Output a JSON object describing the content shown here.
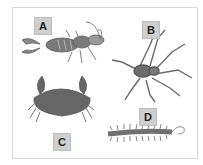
{
  "figure": {
    "panels": [
      {
        "label": "A",
        "animal": "earwig"
      },
      {
        "label": "B",
        "animal": "spider"
      },
      {
        "label": "C",
        "animal": "crab"
      },
      {
        "label": "D",
        "animal": "centipede"
      }
    ],
    "colors": {
      "label_bg": "#cfcfcf",
      "animal_fill": "#6e6e6e",
      "frame": "#d8d8d8"
    }
  }
}
